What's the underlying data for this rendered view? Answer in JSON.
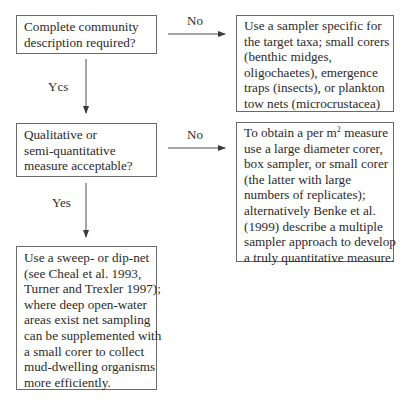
{
  "diagram": {
    "type": "flowchart",
    "nodes": [
      {
        "id": "q1",
        "kind": "decision",
        "lines": [
          "Complete community",
          "description required?"
        ]
      },
      {
        "id": "a1",
        "kind": "outcome",
        "lines": [
          "Use a sampler specific for",
          "the target taxa; small corers",
          "(benthic midges,",
          "oligochaetes), emergence",
          "traps (insects), or plankton",
          "tow nets (microcrustacea)"
        ]
      },
      {
        "id": "q2",
        "kind": "decision",
        "lines": [
          "Qualitative or",
          "semi-quantitative",
          "measure acceptable?"
        ]
      },
      {
        "id": "a2",
        "kind": "outcome",
        "lines_first_prefix": "To obtain a per m",
        "lines_first_sup": "2",
        "lines_first_suffix": " measure",
        "lines": [
          "use a large diameter corer,",
          "box sampler, or small corer",
          "(the latter with large",
          "numbers of replicates);",
          "alternatively Benke et al.",
          "(1999) describe a multiple",
          "sampler approach to develop",
          "a truly quantitative measure."
        ]
      },
      {
        "id": "a3",
        "kind": "outcome",
        "lines": [
          "Use a sweep- or dip-net",
          "(see Cheal et al. 1993,",
          "Turner and Trexler 1997);",
          "where deep open-water",
          "areas exist net sampling",
          "can be supplemented with",
          "a small corer to collect",
          "mud-dwelling organisms",
          "more efficiently."
        ]
      }
    ],
    "edges": [
      {
        "from": "q1",
        "to": "a1",
        "label": "No"
      },
      {
        "from": "q1",
        "to": "q2",
        "label": "Ycs"
      },
      {
        "from": "q2",
        "to": "a2",
        "label": "No"
      },
      {
        "from": "q2",
        "to": "a3",
        "label": "Yes"
      }
    ],
    "colors": {
      "line": "#4a4a4a",
      "border": "#6a6a6a",
      "text": "#2a2a2a",
      "background": "#ffffff"
    }
  }
}
